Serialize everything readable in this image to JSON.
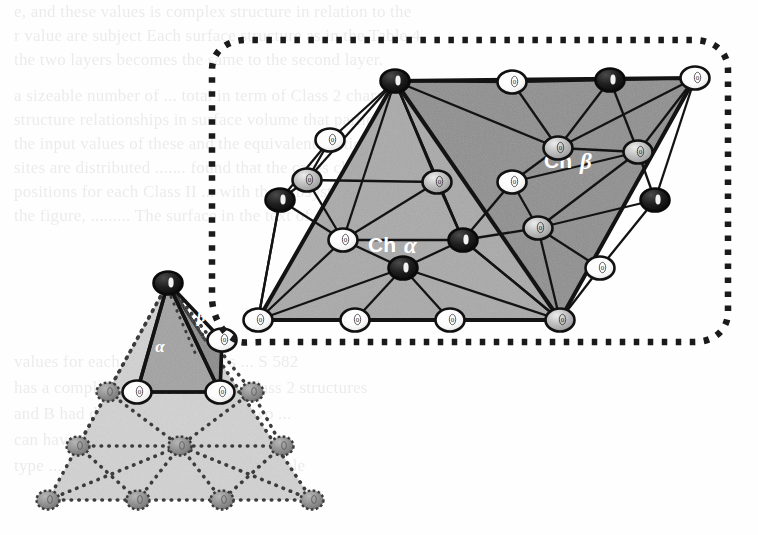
{
  "figure": {
    "kind": "crystallographic-lattice-diagram",
    "labels": {
      "ch_alpha_prefix": "Ch",
      "ch_alpha_symbol": "α",
      "ch_beta_prefix": "Ch",
      "ch_beta_symbol": "β",
      "small_alpha": "α",
      "small_beta": "β",
      "node_mark": "0"
    },
    "colors": {
      "ink": "#1a1a1a",
      "face_alpha_fill": "#a8a8a8",
      "face_beta_fill": "#8d8d8d",
      "small_tetra_light": "#c9c9c9",
      "small_tetra_mid": "#a8a8a8",
      "small_tetra_dark": "#8d8d8d",
      "node_white": "#fbfbfb",
      "node_gray": "#b4b4b4",
      "node_black": "#161616",
      "node_dotted_gray": "#8f8f8f",
      "callout_dots": "#1a1a1a",
      "label_text": "#ffffff",
      "page": "#fefefe"
    },
    "legend": {
      "node_types": [
        {
          "name": "black-node",
          "meaning": "filled site"
        },
        {
          "name": "white-node",
          "meaning": "open site"
        },
        {
          "name": "gray-node",
          "meaning": "half-shaded site"
        }
      ]
    }
  },
  "ghost_text": {
    "note": "Faint show-through text from the underlying scanned page.",
    "lines": [
      "e, and these values is complex structure in relation to the",
      "r  value are subject  Each surface structure as in the  Table 4",
      "the  two  layers  becomes  the  same  to  the  second  layer.",
      "a  sizeable  number  of  ...  total in term of Class 2  characters",
      "structure  relationships in surface  volume that  particular",
      "the  input  values  of  these  and  the  equivalent  vertices",
      "sites  are  distributed ....... found  that the cases chosen for",
      "positions  for  each  Class  II  ... with the  subsystem  which",
      "the  figure, ......... The  surface  in  the  text  of",
      "",
      "values  for  each  of  the  ....  values  ...  S  582",
      "has  a  complex  mixture  of  the  .... Class 2 structures",
      "and  B  had  different  values  of  the  two  ...",
      "can  have  a  Class  I  with  a  ...  W  1",
      "  type   ... for the  positions  ...   the  and  double",
      "    e ...    a                  ..."
    ]
  },
  "callout": {
    "name": "magnifier-callout",
    "style": "dotted-rounded-rectangle",
    "dot_size": 5,
    "dot_gap": 9
  },
  "lattice": {
    "name": "parallelogram-lattice",
    "corner_nodes": [
      "black",
      "white",
      "gray",
      "white"
    ],
    "alpha_half_label": "Ch α",
    "beta_half_label": "Ch β",
    "node_count": 19
  },
  "tetrahedron": {
    "name": "small-tetrahedron",
    "face_labels": [
      "α",
      "β"
    ],
    "edge_style_solid": "front faces",
    "edge_style_dotted": "hidden / base lattice",
    "node_count": 13
  }
}
